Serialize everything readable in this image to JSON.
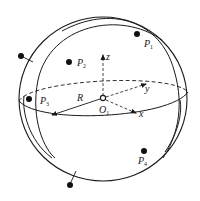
{
  "diagram": {
    "type": "sphere-coordinate-diagram",
    "colors": {
      "stroke": "#1a1a1a",
      "background": "#ffffff"
    },
    "center": {
      "label": "O",
      "subscript": "1"
    },
    "radius_label": "R",
    "axes": [
      {
        "label": "z"
      },
      {
        "label": "y"
      },
      {
        "label": "x"
      }
    ],
    "points_inside": [
      {
        "label": "P",
        "subscript": "1"
      },
      {
        "label": "P",
        "subscript": "2"
      },
      {
        "label": "P",
        "subscript": "3"
      },
      {
        "label": "P",
        "subscript": "4"
      }
    ],
    "points_outside_count": 2
  }
}
